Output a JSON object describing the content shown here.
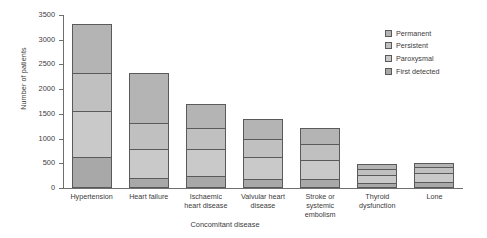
{
  "chart_data": {
    "type": "bar",
    "subtype": "stacked-vertical",
    "title": "",
    "xlabel": "Concomitant disease",
    "ylabel": "Number of patients",
    "ylim": [
      0,
      3500
    ],
    "yticks": [
      0,
      500,
      1000,
      1500,
      2000,
      2500,
      3000,
      3500
    ],
    "grid": false,
    "legend_position": "top-right",
    "categories": [
      "Hypertension",
      "Heart failure",
      "Ischaemic heart disease",
      "Valvular heart disease",
      "Stroke or systemic embolism",
      "Thyroid dysfunction",
      "Lone"
    ],
    "category_label_lines": [
      [
        "Hypertension"
      ],
      [
        "Heart failure"
      ],
      [
        "Ischaemic",
        "heart disease"
      ],
      [
        "Valvular heart",
        "disease"
      ],
      [
        "Stroke or",
        "systemic",
        "embolism"
      ],
      [
        "Thyroid",
        "dysfunction"
      ],
      [
        "Lone"
      ]
    ],
    "series": [
      {
        "name": "First detected",
        "color": "#a8a8a8",
        "values": [
          620,
          200,
          240,
          190,
          180,
          110,
          120
        ]
      },
      {
        "name": "Paroxysmal",
        "color": "#c9c9c9",
        "values": [
          940,
          590,
          540,
          430,
          380,
          160,
          180
        ]
      },
      {
        "name": "Persistent",
        "color": "#c0c0c0",
        "values": [
          760,
          520,
          440,
          380,
          330,
          120,
          130
        ]
      },
      {
        "name": "Permanent",
        "color": "#b4b4b4",
        "values": [
          1000,
          1010,
          470,
          390,
          320,
          100,
          80
        ]
      }
    ],
    "totals": [
      3320,
      2320,
      1690,
      1390,
      1210,
      490,
      510
    ],
    "stack_order_bottom_to_top": [
      "First detected",
      "Paroxysmal",
      "Persistent",
      "Permanent"
    ]
  },
  "legend": {
    "items": [
      {
        "label": "Permanent"
      },
      {
        "label": "Persistent"
      },
      {
        "label": "Paroxysmal"
      },
      {
        "label": "First detected"
      }
    ]
  }
}
